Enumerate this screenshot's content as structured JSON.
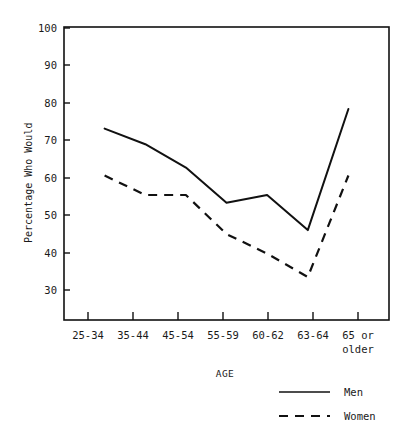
{
  "chart_data": {
    "type": "line",
    "title": "",
    "xlabel": "AGE",
    "ylabel": "Percentage Who Would",
    "categories": [
      "25-34",
      "35-44",
      "45-54",
      "55-59",
      "60-62",
      "63-64",
      "65 or older"
    ],
    "series": [
      {
        "name": "Men",
        "style": "solid",
        "values": [
          74,
          70,
          64,
          55,
          57,
          48,
          79
        ]
      },
      {
        "name": "Women",
        "style": "dashed",
        "values": [
          62,
          57,
          57,
          47,
          42,
          36,
          62
        ]
      }
    ],
    "ylim": [
      25,
      100
    ],
    "yticks": [
      30,
      40,
      50,
      60,
      70,
      80,
      90,
      100
    ],
    "ytick_labels": [
      "30",
      "40",
      "50",
      "60",
      "70",
      "80",
      "90",
      "100"
    ],
    "grid": false,
    "legend_position": "bottom-right",
    "axis_color": "#111111",
    "line_color": "#111111",
    "background": "#ffffff"
  },
  "axes": {
    "y_title": "Percentage Who Would",
    "x_title": "AGE"
  },
  "ytick_labels": {
    "t0": "30",
    "t1": "40",
    "t2": "50",
    "t3": "60",
    "t4": "70",
    "t5": "80",
    "t6": "90",
    "t7": "100"
  },
  "xtick_labels": {
    "c0": "25-34",
    "c1": "35-44",
    "c2": "45-54",
    "c3": "55-59",
    "c4": "60-62",
    "c5": "63-64",
    "c6_line1": "65 or",
    "c6_line2": "older"
  },
  "legend": {
    "items": [
      {
        "label": "Men",
        "style": "solid"
      },
      {
        "label": "Women",
        "style": "dashed"
      }
    ],
    "men_label": "Men",
    "women_label": "Women"
  }
}
